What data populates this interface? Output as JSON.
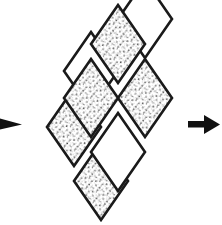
{
  "figure": {
    "title": "Interlaced rhombus bands diagram",
    "background_color": "#ffffff",
    "stroke_color": "#1a1a1a",
    "fill_white": "#ffffff",
    "stipple_color": "#3a3a3a",
    "arrow_color": "#111111",
    "width": 222,
    "height": 225
  },
  "arrows": [
    {
      "name": "left-arrow",
      "label": "left arrow pointing right",
      "direction": "right",
      "clipped": true,
      "x": 0,
      "y": 124,
      "points": "0,117 0,131 22,124"
    },
    {
      "name": "right-arrow",
      "label": "right arrow pointing right",
      "direction": "right",
      "clipped": false,
      "x": 188,
      "y": 124,
      "shaft": {
        "x": 188,
        "y": 121,
        "width": 20,
        "height": 6
      },
      "head": "205,114 205,134 220,124"
    }
  ],
  "bands": [
    {
      "name": "band-a",
      "label": "Band A (upper-right leaning strip)",
      "orientation": "down-left",
      "rhombi": [
        {
          "name": "rhombus-a1",
          "fill": "stippled",
          "cx": 118,
          "cy": 44,
          "rx": 27,
          "ry": 39
        },
        {
          "name": "rhombus-a2",
          "fill": "white",
          "cx": 145,
          "cy": 19,
          "rx": 27,
          "ry": 39
        },
        {
          "name": "rhombus-a3",
          "fill": "stippled",
          "cx": 145,
          "cy": 98,
          "rx": 27,
          "ry": 39
        },
        {
          "name": "rhombus-a4",
          "fill": "white",
          "cx": 118,
          "cy": 152,
          "rx": 27,
          "ry": 39
        },
        {
          "name": "rhombus-a5",
          "fill": "stippled",
          "cx": 91,
          "cy": 98,
          "rx": 27,
          "ry": 39
        }
      ]
    },
    {
      "name": "band-b",
      "label": "Band B (lower-left leaning strip)",
      "orientation": "down-right",
      "rhombi": [
        {
          "name": "rhombus-b1",
          "fill": "white",
          "cx": 91,
          "cy": 71,
          "rx": 27,
          "ry": 39
        },
        {
          "name": "rhombus-b2",
          "fill": "stippled",
          "cx": 74,
          "cy": 127,
          "rx": 27,
          "ry": 39
        },
        {
          "name": "rhombus-b3",
          "fill": "stippled",
          "cx": 101,
          "cy": 181,
          "rx": 27,
          "ry": 39
        }
      ]
    }
  ],
  "legend": {
    "stippled_label": "stippled face",
    "white_label": "plain face"
  }
}
